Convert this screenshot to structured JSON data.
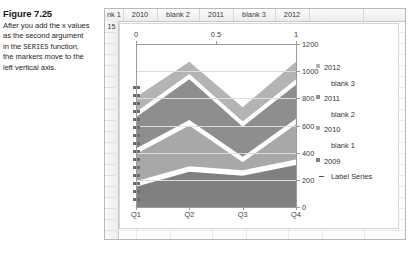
{
  "caption": {
    "figure_label": "Figure 7.25",
    "line1": "After you add the x values",
    "line2": "as the second argument",
    "line3_pre": "in the ",
    "line3_mono": "SERIES",
    "line3_post": " function,",
    "line4": "the markers move to the",
    "line5": "left vertical axis."
  },
  "spreadsheet": {
    "column_headers": [
      "nk 1",
      "2010",
      "blank 2",
      "2011",
      "blank 3",
      "2012"
    ],
    "row_headers": [
      "15"
    ]
  },
  "chart_data": {
    "type": "area",
    "title": "",
    "xlabel": "",
    "ylabel": "",
    "categories": [
      "Q1",
      "Q2",
      "Q3",
      "Q4"
    ],
    "grid": true,
    "legend_position": "right",
    "primary_axis": {
      "position": "right",
      "ticks": [
        "0",
        "200",
        "400",
        "600",
        "800",
        "1000",
        "1200"
      ],
      "ylim": [
        0,
        1200
      ]
    },
    "secondary_axis": {
      "position": "top",
      "ticks": [
        "0",
        "0.5",
        "1"
      ],
      "xlim": [
        0,
        1
      ]
    },
    "series": [
      {
        "name": "2009",
        "color": "#808080",
        "values": [
          150,
          260,
          230,
          310
        ]
      },
      {
        "name": "blank 1",
        "color": "#ffffff",
        "values": [
          40,
          40,
          40,
          40
        ]
      },
      {
        "name": "2010",
        "color": "#a8a8a8",
        "values": [
          200,
          300,
          60,
          260
        ]
      },
      {
        "name": "blank 2",
        "color": "#ffffff",
        "values": [
          40,
          40,
          40,
          40
        ]
      },
      {
        "name": "2011",
        "color": "#8e8e8e",
        "values": [
          230,
          300,
          220,
          250
        ]
      },
      {
        "name": "blank 3",
        "color": "#ffffff",
        "values": [
          40,
          40,
          40,
          40
        ]
      },
      {
        "name": "2012",
        "color": "#b4b4b4",
        "values": [
          110,
          90,
          105,
          130
        ]
      },
      {
        "name": "Label Series",
        "color": "#555555",
        "values": [
          0,
          0,
          0,
          0
        ]
      }
    ],
    "legend_entries": [
      {
        "label": "2012",
        "marker": "square",
        "color": "#b4b4b4",
        "indent": false
      },
      {
        "label": "blank 3",
        "marker": "none",
        "color": "#ffffff",
        "indent": true
      },
      {
        "label": "2011",
        "marker": "square",
        "color": "#8e8e8e",
        "indent": false
      },
      {
        "label": "blank 2",
        "marker": "none",
        "color": "#ffffff",
        "indent": true
      },
      {
        "label": "2010",
        "marker": "square",
        "color": "#a8a8a8",
        "indent": false
      },
      {
        "label": "blank 1",
        "marker": "none",
        "color": "#ffffff",
        "indent": true
      },
      {
        "label": "2009",
        "marker": "square",
        "color": "#808080",
        "indent": false
      },
      {
        "label": "Label Series",
        "marker": "dash",
        "color": "#555555",
        "indent": true
      }
    ],
    "label_series_markers": {
      "description": "Label Series data markers stacked along the left vertical axis",
      "count": 17,
      "color": "#6b6b6b"
    }
  }
}
